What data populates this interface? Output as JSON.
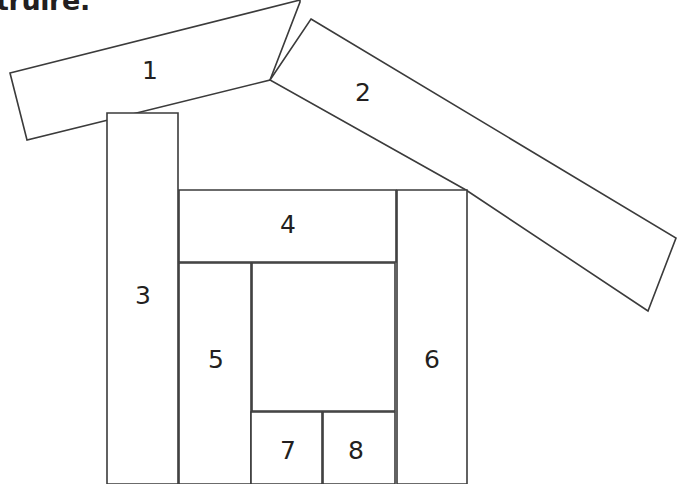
{
  "caption": {
    "text": "truire."
  },
  "figure": {
    "background_color": "#ffffff",
    "stroke_color": "#3b3b3b",
    "fill_color": "#ffffff",
    "text_color": "#231f20",
    "pieces": [
      {
        "id": "piece-1",
        "label": "1",
        "role": "left-roof-slope",
        "points": "10,73 300,0 300,2 270,80 27,140",
        "label_x": 150,
        "label_y": 72
      },
      {
        "id": "piece-2",
        "label": "2",
        "role": "right-roof-slope",
        "points": "311,19 676,238 648,311 466,190 270,80",
        "label_x": 363,
        "label_y": 94
      },
      {
        "id": "piece-3",
        "label": "3",
        "role": "left-wall-column",
        "points": "107,113 178,113 178,484 107,484",
        "label_x": 143,
        "label_y": 297
      },
      {
        "id": "piece-4",
        "label": "4",
        "role": "upper-horizontal-beam",
        "points": "179,190 396,190 396,262 179,262",
        "label_x": 288,
        "label_y": 226
      },
      {
        "id": "piece-5",
        "label": "5",
        "role": "inner-left-column",
        "points": "179,263 251,263 251,484 179,484",
        "label_x": 216,
        "label_y": 361
      },
      {
        "id": "piece-6",
        "label": "6",
        "role": "right-wall-column",
        "points": "397,190 467,190 467,484 397,484",
        "label_x": 432,
        "label_y": 361
      },
      {
        "id": "piece-7",
        "label": "7",
        "role": "bottom-left-block",
        "points": "251,412 322,412 322,484 251,484",
        "label_x": 288,
        "label_y": 452
      },
      {
        "id": "piece-8",
        "label": "8",
        "role": "bottom-right-block",
        "points": "323,412 395,412 395,484 323,484",
        "label_x": 356,
        "label_y": 452
      },
      {
        "id": "piece-doorway",
        "label": "",
        "role": "inner-open-space",
        "points": "252,263 395,263 395,411 252,411",
        "label_x": 0,
        "label_y": 0
      }
    ]
  }
}
